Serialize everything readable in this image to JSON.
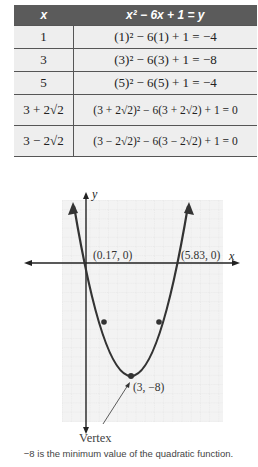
{
  "table": {
    "headers": [
      "x",
      "x² − 6x + 1 = y"
    ],
    "rows": [
      {
        "x": "1",
        "expr": "(1)² − 6(1) + 1 = −4"
      },
      {
        "x": "3",
        "expr": "(3)² − 6(3) + 1 = −8"
      },
      {
        "x": "5",
        "expr": "(5)² − 6(5) + 1 = −4"
      },
      {
        "x": "3 + 2√2",
        "expr": "(3 + 2√2)² − 6(3 + 2√2) + 1 = 0"
      },
      {
        "x": "3 − 2√2",
        "expr": "(3 − 2√2)² − 6(3 − 2√2) + 1 = 0"
      }
    ]
  },
  "graph": {
    "x_axis_label": "x",
    "y_axis_label": "y",
    "root_left_label": "(0.17, 0)",
    "root_right_label": "(5.83, 0)",
    "vertex_label": "(3, −8)",
    "vertex_callout": "Vertex",
    "colors": {
      "curve": "#333333",
      "grid": "#c8c8c8",
      "grid_bg": "#f2f2f2"
    }
  },
  "caption": "−8 is the minimum value of the quadratic function."
}
